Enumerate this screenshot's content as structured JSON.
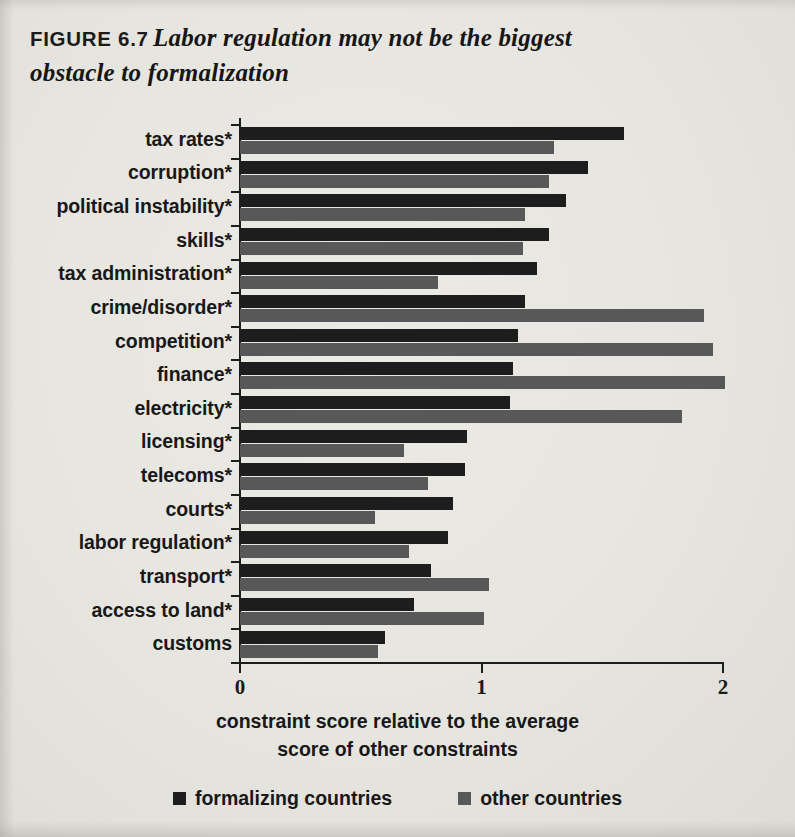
{
  "figure": {
    "number": "FIGURE 6.7",
    "title_line1": "Labor regulation may not be the biggest",
    "title_line2": "obstacle to formalization"
  },
  "colors": {
    "formalizing": "#1d1d1d",
    "other": "#585858",
    "axis": "#1d1d1d",
    "paper": "#e9e7e2"
  },
  "legend": {
    "items": [
      {
        "label": "formalizing countries",
        "color": "#1d1d1d",
        "swatch": "square-dark"
      },
      {
        "label": "other countries",
        "color": "#585858",
        "swatch": "square-gray"
      }
    ]
  },
  "axis": {
    "caption_line1": "constraint score relative to the average",
    "caption_line2": "score of other constraints",
    "ticks": [
      "0",
      "1",
      "2"
    ]
  },
  "chart_data": {
    "type": "bar",
    "orientation": "horizontal",
    "title": "FIGURE 6.7  Labor regulation may not be the biggest obstacle to formalization",
    "subtitle": "",
    "xlabel": "constraint score relative to the average score of other constraints",
    "ylabel": "",
    "xlim": [
      0,
      2
    ],
    "xticks": [
      0,
      1,
      2
    ],
    "grid": false,
    "legend_position": "bottom",
    "categories": [
      "tax rates*",
      "corruption*",
      "political instability*",
      "skills*",
      "tax administration*",
      "crime/disorder*",
      "competition*",
      "finance*",
      "electricity*",
      "licensing*",
      "telecoms*",
      "courts*",
      "labor regulation*",
      "transport*",
      "access to land*",
      "customs"
    ],
    "series": [
      {
        "name": "formalizing countries",
        "color": "#1d1d1d",
        "values": [
          1.59,
          1.44,
          1.35,
          1.28,
          1.23,
          1.18,
          1.15,
          1.13,
          1.12,
          0.94,
          0.93,
          0.88,
          0.86,
          0.79,
          0.72,
          0.6
        ]
      },
      {
        "name": "other countries",
        "color": "#585858",
        "values": [
          1.3,
          1.28,
          1.18,
          1.17,
          0.82,
          1.92,
          1.96,
          2.01,
          1.83,
          0.68,
          0.78,
          0.56,
          0.7,
          1.03,
          1.01,
          0.57
        ]
      }
    ]
  }
}
